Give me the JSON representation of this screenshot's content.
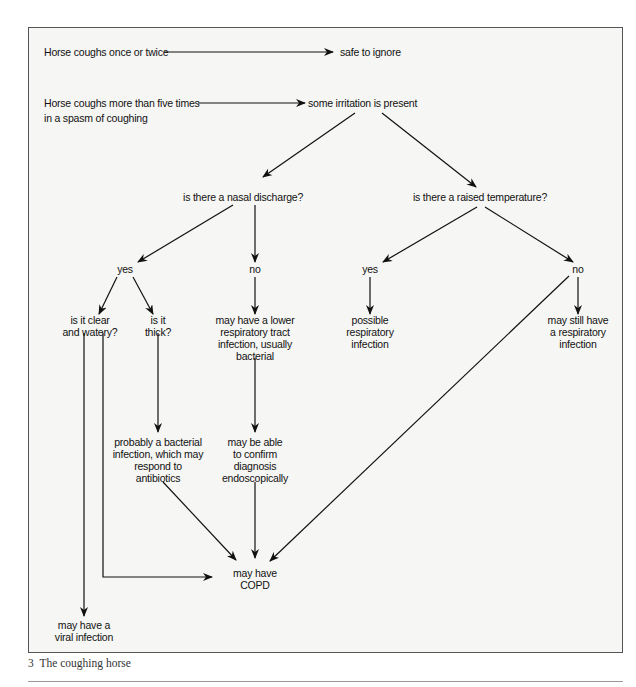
{
  "diagram": {
    "type": "flowchart",
    "title": "The coughing horse",
    "nodes": {
      "once_twice": "Horse coughs once or twice",
      "safe": "safe to ignore",
      "more_five_1": "Horse coughs more than five times",
      "more_five_2": "in a spasm of coughing",
      "irritation": "some irritation is present",
      "nasal_q": "is there a nasal discharge?",
      "temp_q": "is there a raised temperature?",
      "nasal_yes": "yes",
      "nasal_no": "no",
      "temp_yes": "yes",
      "temp_no": "no",
      "clear_1": "is it clear",
      "clear_2": "and watery?",
      "thick_1": "is it",
      "thick_2": "thick?",
      "lower_1": "may have a lower",
      "lower_2": "respiratory tract",
      "lower_3": "infection, usually",
      "lower_4": "bacterial",
      "possible_1": "possible",
      "possible_2": "respiratory",
      "possible_3": "infection",
      "still_1": "may still have",
      "still_2": "a respiratory",
      "still_3": "infection",
      "bacterial_1": "probably a bacterial",
      "bacterial_2": "infection, which may",
      "bacterial_3": "respond to",
      "bacterial_4": "antibiotics",
      "endo_1": "may be able",
      "endo_2": "to confirm",
      "endo_3": "diagnosis",
      "endo_4": "endoscopically",
      "copd_1": "may have",
      "copd_2": "COPD",
      "viral_1": "may have a",
      "viral_2": "viral infection"
    },
    "edges": [
      [
        "Horse coughs once or twice",
        "safe to ignore"
      ],
      [
        "Horse coughs more than five times in a spasm of coughing",
        "some irritation is present"
      ],
      [
        "some irritation is present",
        "is there a nasal discharge?"
      ],
      [
        "some irritation is present",
        "is there a raised temperature?"
      ],
      [
        "is there a nasal discharge?",
        "yes"
      ],
      [
        "is there a nasal discharge?",
        "no"
      ],
      [
        "is there a raised temperature?",
        "yes"
      ],
      [
        "is there a raised temperature?",
        "no"
      ],
      [
        "yes (nasal)",
        "is it clear and watery?"
      ],
      [
        "yes (nasal)",
        "is it thick?"
      ],
      [
        "no (nasal)",
        "may have a lower respiratory tract infection, usually bacterial"
      ],
      [
        "yes (temperature)",
        "possible respiratory infection"
      ],
      [
        "no (temperature)",
        "may still have a respiratory infection"
      ],
      [
        "no (temperature)",
        "may have COPD"
      ],
      [
        "is it thick?",
        "probably a bacterial infection, which may respond to antibiotics"
      ],
      [
        "may have a lower respiratory tract infection, usually bacterial",
        "may be able to confirm diagnosis endoscopically"
      ],
      [
        "probably a bacterial infection, which may respond to antibiotics",
        "may have COPD"
      ],
      [
        "may be able to confirm diagnosis endoscopically",
        "may have COPD"
      ],
      [
        "is it clear and watery?",
        "may have COPD"
      ],
      [
        "is it clear and watery?",
        "may have a viral infection"
      ]
    ]
  },
  "caption": {
    "number": "3",
    "text": "The coughing horse",
    "full": "3  The coughing horse"
  },
  "colors": {
    "ink": "#111111",
    "frame_bg": "#f6f6f4",
    "frame_border": "#555555"
  }
}
